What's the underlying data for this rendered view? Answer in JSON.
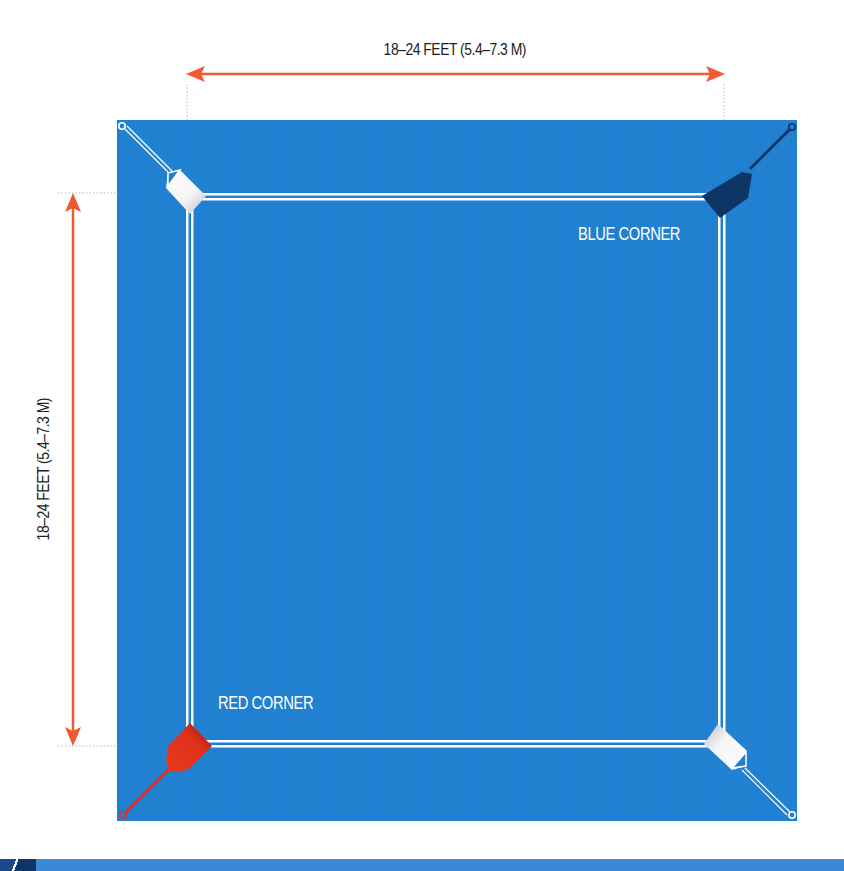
{
  "diagram": {
    "width_label": "18–24 FEET (5.4–7.3 M)",
    "height_label": "18–24 FEET (5.4–7.3 M)",
    "corners": {
      "blue": {
        "label": "BLUE CORNER",
        "color": "#0d3566"
      },
      "red": {
        "label": "RED CORNER",
        "color": "#e1301c"
      },
      "neutral_top_left": {
        "color": "#ffffff"
      },
      "neutral_bottom_right": {
        "color": "#ffffff"
      }
    },
    "colors": {
      "mat": "#1f7fd0",
      "ropes": "#ffffff",
      "dimension_arrows": "#ef5a30",
      "guide_lines": "#b0b0b0"
    }
  }
}
